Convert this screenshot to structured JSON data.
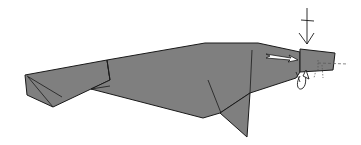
{
  "diagram": {
    "colors": {
      "background": "#ffffff",
      "paper": "#7f7f7f",
      "outline": "#1a1a1a",
      "arrow_fill": "#ffffff"
    },
    "symbols": [
      {
        "name": "valley-fold-arrow-down",
        "description": "downward push arrow with crossbar above head"
      },
      {
        "name": "push-arrow-right",
        "description": "hollow white arrow pointing right into head"
      },
      {
        "name": "rotate-arrow",
        "description": "curved arrow under the snout"
      },
      {
        "name": "dashed-fold-line",
        "description": "dash-dot fold line across snout"
      }
    ]
  }
}
